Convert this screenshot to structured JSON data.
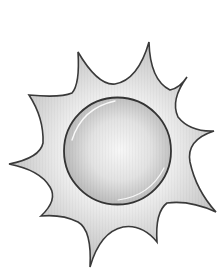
{
  "illustration": {
    "subject": "sun",
    "icon": "sun-icon",
    "style": "grayscale clip-art",
    "ray_count": 10,
    "colors": {
      "background": "#ffffff",
      "outline": "#3a3a3a",
      "ray_light": "#f2f2f2",
      "ray_dark": "#c4c4c4",
      "disc_center": "#f6f6f6",
      "disc_edge": "#bcbcbc",
      "highlight": "#ffffff"
    },
    "disc": {
      "cx": 117.5,
      "cy": 151,
      "r": 53.5
    }
  }
}
